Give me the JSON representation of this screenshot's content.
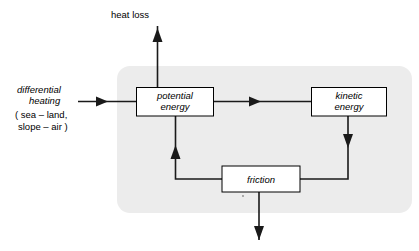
{
  "diagram": {
    "panel": {
      "name": "system-boundary-panel",
      "fill": "#ececec"
    },
    "nodes": [
      {
        "id": "potential-energy",
        "label_line1": "potential",
        "label_line2": "energy"
      },
      {
        "id": "kinetic-energy",
        "label_line1": "kinetic",
        "label_line2": "energy"
      },
      {
        "id": "friction",
        "label_line1": "friction",
        "label_line2": ""
      }
    ],
    "external_labels": {
      "heat_loss": "heat loss",
      "input_line1": "differential",
      "input_line2": "heating",
      "input_line3": "( sea – land,",
      "input_line4": "slope – air )"
    },
    "edges": [
      {
        "id": "input-to-potential",
        "from": "differential heating",
        "to": "potential energy"
      },
      {
        "id": "potential-to-kinetic",
        "from": "potential energy",
        "to": "kinetic energy"
      },
      {
        "id": "potential-to-heat-loss",
        "from": "potential energy",
        "to": "heat loss"
      },
      {
        "id": "kinetic-to-friction",
        "from": "kinetic energy",
        "to": "friction"
      },
      {
        "id": "friction-to-potential",
        "from": "friction",
        "to": "potential energy"
      },
      {
        "id": "friction-outflow",
        "from": "friction",
        "to": ""
      }
    ],
    "colors": {
      "line": "#1a1a1a",
      "node_fill": "#ffffff",
      "node_stroke": "#000000",
      "panel_fill": "#ececec",
      "page_background": "#ffffff"
    }
  }
}
